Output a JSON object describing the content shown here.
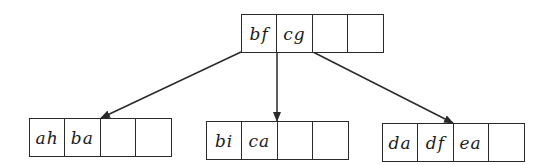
{
  "diagram": {
    "type": "b-tree",
    "root": {
      "keys": [
        "bf",
        "cg",
        "",
        ""
      ]
    },
    "children": [
      {
        "keys": [
          "ah",
          "ba",
          "",
          ""
        ]
      },
      {
        "keys": [
          "bi",
          "ca",
          "",
          ""
        ]
      },
      {
        "keys": [
          "da",
          "df",
          "ea",
          ""
        ]
      }
    ],
    "colors": {
      "line": "#2a2a2a",
      "text": "#1a1a1a",
      "background": "#ffffff"
    }
  }
}
